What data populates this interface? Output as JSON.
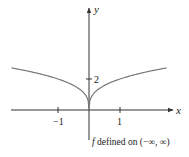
{
  "chart_data": {
    "type": "line",
    "title": "",
    "function": "f(x) = 2·x^(1/3)^2 style cusp, approx y = 2|x|^(1/3)",
    "xlabel": "x",
    "ylabel": "y",
    "x_ticks": [
      -1,
      1
    ],
    "x_tick_labels": [
      "−1",
      "1"
    ],
    "y_ticks": [
      2
    ],
    "y_tick_labels": [
      "2"
    ],
    "xlim": [
      -2.5,
      2.5
    ],
    "ylim": [
      0,
      3
    ],
    "grid": false,
    "series": [
      {
        "name": "f",
        "x": [
          -2.5,
          -2,
          -1.5,
          -1,
          -0.5,
          -0.25,
          -0.1,
          0,
          0.1,
          0.25,
          0.5,
          1,
          1.5,
          2,
          2.5
        ],
        "values": [
          2.71,
          2.52,
          2.29,
          2.0,
          1.59,
          1.26,
          0.93,
          0,
          0.93,
          1.26,
          1.59,
          2.0,
          2.29,
          2.52,
          2.71
        ]
      }
    ],
    "annotation": "f defined on (−∞, ∞)"
  },
  "labels": {
    "x_axis": "x",
    "y_axis": "y",
    "tick_neg1": "−1",
    "tick_pos1": "1",
    "tick_y2": "2",
    "caption_f": "f",
    "caption_rest": " defined on (−∞, ∞)"
  },
  "colors": {
    "axis": "#333333",
    "curve": "#777777"
  }
}
